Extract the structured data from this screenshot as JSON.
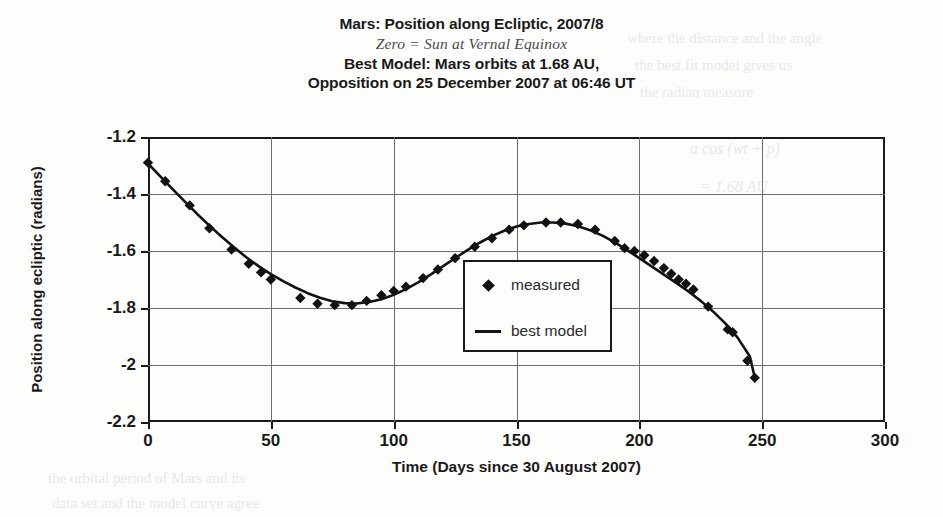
{
  "title": {
    "line1": "Mars: Position along Ecliptic, 2007/8",
    "line2": "Zero = Sun at Vernal Equinox",
    "line3": "Best Model: Mars orbits at 1.68 AU,",
    "line4": "Opposition on 25 December 2007 at 06:46 UT"
  },
  "legend": {
    "measured_label": "measured",
    "model_label": "best model"
  },
  "bleed_text": {
    "l1": "where  the  distance  and  the  angle",
    "l2": "the  best  fit  model  gives  us",
    "l3": "the  radian  measure",
    "l4": "a cos (wt + p)",
    "l5": "= 1.68 AU",
    "l6": "the  orbital  period  of  Mars  and  its",
    "l7": "data  set  and  the  model  curve  agree"
  },
  "chart_data": {
    "type": "scatter",
    "title": "Mars: Position along Ecliptic, 2007/8",
    "subtitle": "Zero = Sun at Vernal Equinox",
    "xlabel": "Time (Days since 30 August 2007)",
    "ylabel": "Position along ecliptic (radians)",
    "xlim": [
      0,
      300
    ],
    "ylim": [
      -2.2,
      -1.2
    ],
    "xticks": [
      0,
      50,
      100,
      150,
      200,
      250,
      300
    ],
    "yticks": [
      -1.2,
      -1.4,
      -1.6,
      -1.8,
      -2,
      -2.2
    ],
    "ytick_labels": [
      "-1.2",
      "-1.4",
      "-1.6",
      "-1.8",
      "-2",
      "-2.2"
    ],
    "xtick_labels": [
      "0",
      "50",
      "100",
      "150",
      "200",
      "250",
      "300"
    ],
    "grid": true,
    "legend_position": "center",
    "series": [
      {
        "name": "measured",
        "type": "scatter",
        "marker": "diamond",
        "color": "#121212",
        "points": [
          [
            0,
            -1.29
          ],
          [
            7,
            -1.355
          ],
          [
            17,
            -1.44
          ],
          [
            25,
            -1.52
          ],
          [
            34,
            -1.595
          ],
          [
            41,
            -1.645
          ],
          [
            46,
            -1.675
          ],
          [
            50,
            -1.7
          ],
          [
            62,
            -1.765
          ],
          [
            69,
            -1.785
          ],
          [
            76,
            -1.79
          ],
          [
            83,
            -1.79
          ],
          [
            89,
            -1.775
          ],
          [
            95,
            -1.755
          ],
          [
            100,
            -1.74
          ],
          [
            105,
            -1.725
          ],
          [
            112,
            -1.695
          ],
          [
            118,
            -1.665
          ],
          [
            125,
            -1.625
          ],
          [
            133,
            -1.585
          ],
          [
            140,
            -1.555
          ],
          [
            147,
            -1.525
          ],
          [
            153,
            -1.51
          ],
          [
            162,
            -1.5
          ],
          [
            168,
            -1.5
          ],
          [
            175,
            -1.505
          ],
          [
            182,
            -1.525
          ],
          [
            190,
            -1.565
          ],
          [
            194,
            -1.59
          ],
          [
            198,
            -1.6
          ],
          [
            202,
            -1.615
          ],
          [
            206,
            -1.635
          ],
          [
            210,
            -1.66
          ],
          [
            213,
            -1.68
          ],
          [
            216,
            -1.7
          ],
          [
            219,
            -1.715
          ],
          [
            222,
            -1.735
          ],
          [
            228,
            -1.795
          ],
          [
            236,
            -1.875
          ],
          [
            238,
            -1.885
          ],
          [
            244,
            -1.985
          ],
          [
            247,
            -2.045
          ]
        ]
      },
      {
        "name": "best model",
        "type": "line",
        "color": "#121212",
        "points": [
          [
            0,
            -1.293
          ],
          [
            5,
            -1.338
          ],
          [
            10,
            -1.383
          ],
          [
            15,
            -1.427
          ],
          [
            20,
            -1.47
          ],
          [
            25,
            -1.511
          ],
          [
            30,
            -1.55
          ],
          [
            35,
            -1.587
          ],
          [
            40,
            -1.622
          ],
          [
            45,
            -1.653
          ],
          [
            50,
            -1.681
          ],
          [
            55,
            -1.706
          ],
          [
            60,
            -1.728
          ],
          [
            65,
            -1.748
          ],
          [
            70,
            -1.764
          ],
          [
            75,
            -1.776
          ],
          [
            80,
            -1.783
          ],
          [
            85,
            -1.784
          ],
          [
            90,
            -1.779
          ],
          [
            95,
            -1.769
          ],
          [
            100,
            -1.754
          ],
          [
            105,
            -1.734
          ],
          [
            110,
            -1.71
          ],
          [
            115,
            -1.683
          ],
          [
            120,
            -1.654
          ],
          [
            125,
            -1.625
          ],
          [
            130,
            -1.597
          ],
          [
            135,
            -1.571
          ],
          [
            140,
            -1.548
          ],
          [
            145,
            -1.529
          ],
          [
            150,
            -1.514
          ],
          [
            155,
            -1.505
          ],
          [
            160,
            -1.5
          ],
          [
            165,
            -1.5
          ],
          [
            170,
            -1.504
          ],
          [
            175,
            -1.513
          ],
          [
            180,
            -1.527
          ],
          [
            185,
            -1.546
          ],
          [
            190,
            -1.57
          ],
          [
            195,
            -1.597
          ],
          [
            200,
            -1.625
          ],
          [
            205,
            -1.654
          ],
          [
            210,
            -1.683
          ],
          [
            215,
            -1.712
          ],
          [
            220,
            -1.742
          ],
          [
            225,
            -1.775
          ],
          [
            230,
            -1.812
          ],
          [
            235,
            -1.854
          ],
          [
            240,
            -1.904
          ],
          [
            245,
            -1.97
          ],
          [
            247,
            -2.045
          ]
        ]
      }
    ]
  }
}
